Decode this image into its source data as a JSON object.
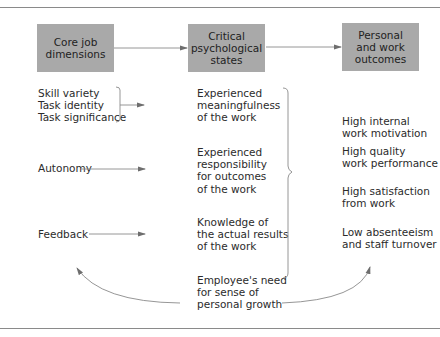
{
  "diagram": {
    "headers": {
      "core": "Core job\ndimensions",
      "critical": "Critical\npsychological\nstates",
      "outcomes": "Personal\nand work\noutcomes"
    },
    "core_dimensions": {
      "group1": "Skill variety\nTask identity\nTask significance",
      "autonomy": "Autonomy",
      "feedback": "Feedback"
    },
    "psychological_states": {
      "meaningfulness": "Experienced\nmeaningfulness\nof the work",
      "responsibility": "Experienced\nresponsibility\nfor outcomes\nof the work",
      "knowledge": "Knowledge of\nthe actual results\nof the work"
    },
    "outcomes": {
      "motivation": "High internal\nwork motivation",
      "performance": "High quality\nwork performance",
      "satisfaction": "High satisfaction\nfrom work",
      "absenteeism": "Low absenteeism\nand staff turnover"
    },
    "moderator": "Employee's need\nfor sense of\npersonal growth",
    "colors": {
      "box_fill": "#a9a9a9",
      "line": "#7a7a7a",
      "text": "#2b2b2b"
    }
  }
}
